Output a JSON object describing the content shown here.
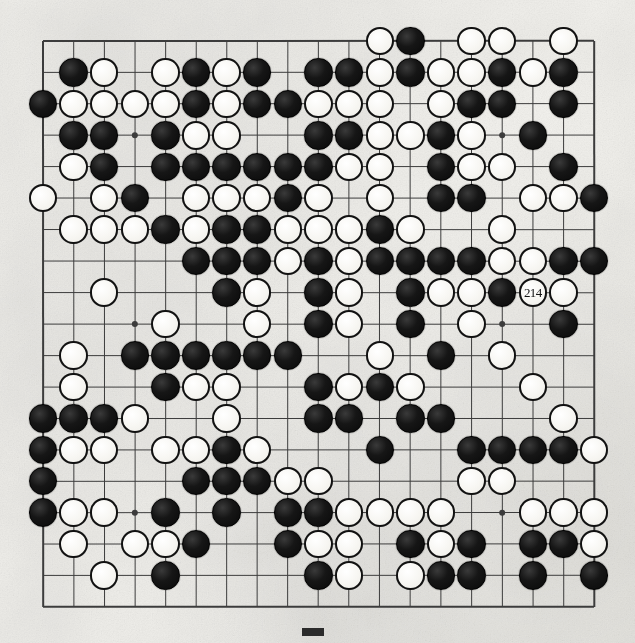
{
  "diagram": {
    "kind": "go-game-record",
    "board_size": 19,
    "title": "",
    "caption": "",
    "background_color": "#f2f1ed",
    "line_color": "#3c3c3c",
    "black_color": "#111111",
    "white_color": "#f9f8f4",
    "star_points": [
      [
        3,
        3
      ],
      [
        3,
        9
      ],
      [
        3,
        15
      ],
      [
        9,
        3
      ],
      [
        9,
        9
      ],
      [
        9,
        15
      ],
      [
        15,
        3
      ],
      [
        15,
        9
      ],
      [
        15,
        15
      ]
    ],
    "move_labels": [
      {
        "label": "214",
        "col": 16,
        "row": 8,
        "color": "white"
      }
    ],
    "stones": [
      {
        "c": 11,
        "r": 0,
        "s": "W"
      },
      {
        "c": 12,
        "r": 0,
        "s": "B"
      },
      {
        "c": 14,
        "r": 0,
        "s": "W"
      },
      {
        "c": 15,
        "r": 0,
        "s": "W"
      },
      {
        "c": 17,
        "r": 0,
        "s": "W"
      },
      {
        "c": 1,
        "r": 1,
        "s": "B"
      },
      {
        "c": 2,
        "r": 1,
        "s": "W"
      },
      {
        "c": 4,
        "r": 1,
        "s": "W"
      },
      {
        "c": 5,
        "r": 1,
        "s": "B"
      },
      {
        "c": 6,
        "r": 1,
        "s": "W"
      },
      {
        "c": 7,
        "r": 1,
        "s": "B"
      },
      {
        "c": 9,
        "r": 1,
        "s": "B"
      },
      {
        "c": 10,
        "r": 1,
        "s": "B"
      },
      {
        "c": 11,
        "r": 1,
        "s": "W"
      },
      {
        "c": 12,
        "r": 1,
        "s": "B"
      },
      {
        "c": 13,
        "r": 1,
        "s": "W"
      },
      {
        "c": 14,
        "r": 1,
        "s": "W"
      },
      {
        "c": 15,
        "r": 1,
        "s": "B"
      },
      {
        "c": 16,
        "r": 1,
        "s": "W"
      },
      {
        "c": 17,
        "r": 1,
        "s": "B"
      },
      {
        "c": 0,
        "r": 2,
        "s": "B"
      },
      {
        "c": 1,
        "r": 2,
        "s": "W"
      },
      {
        "c": 2,
        "r": 2,
        "s": "W"
      },
      {
        "c": 3,
        "r": 2,
        "s": "W"
      },
      {
        "c": 4,
        "r": 2,
        "s": "W"
      },
      {
        "c": 5,
        "r": 2,
        "s": "B"
      },
      {
        "c": 6,
        "r": 2,
        "s": "W"
      },
      {
        "c": 7,
        "r": 2,
        "s": "B"
      },
      {
        "c": 8,
        "r": 2,
        "s": "B"
      },
      {
        "c": 9,
        "r": 2,
        "s": "W"
      },
      {
        "c": 10,
        "r": 2,
        "s": "W"
      },
      {
        "c": 11,
        "r": 2,
        "s": "W"
      },
      {
        "c": 13,
        "r": 2,
        "s": "W"
      },
      {
        "c": 14,
        "r": 2,
        "s": "B"
      },
      {
        "c": 15,
        "r": 2,
        "s": "B"
      },
      {
        "c": 17,
        "r": 2,
        "s": "B"
      },
      {
        "c": 1,
        "r": 3,
        "s": "B"
      },
      {
        "c": 2,
        "r": 3,
        "s": "B"
      },
      {
        "c": 4,
        "r": 3,
        "s": "B"
      },
      {
        "c": 5,
        "r": 3,
        "s": "W"
      },
      {
        "c": 6,
        "r": 3,
        "s": "W"
      },
      {
        "c": 9,
        "r": 3,
        "s": "B"
      },
      {
        "c": 10,
        "r": 3,
        "s": "B"
      },
      {
        "c": 11,
        "r": 3,
        "s": "W"
      },
      {
        "c": 12,
        "r": 3,
        "s": "W"
      },
      {
        "c": 13,
        "r": 3,
        "s": "B"
      },
      {
        "c": 14,
        "r": 3,
        "s": "W"
      },
      {
        "c": 16,
        "r": 3,
        "s": "B"
      },
      {
        "c": 1,
        "r": 4,
        "s": "W"
      },
      {
        "c": 2,
        "r": 4,
        "s": "B"
      },
      {
        "c": 4,
        "r": 4,
        "s": "B"
      },
      {
        "c": 5,
        "r": 4,
        "s": "B"
      },
      {
        "c": 6,
        "r": 4,
        "s": "B"
      },
      {
        "c": 7,
        "r": 4,
        "s": "B"
      },
      {
        "c": 8,
        "r": 4,
        "s": "B"
      },
      {
        "c": 9,
        "r": 4,
        "s": "B"
      },
      {
        "c": 10,
        "r": 4,
        "s": "W"
      },
      {
        "c": 11,
        "r": 4,
        "s": "W"
      },
      {
        "c": 13,
        "r": 4,
        "s": "B"
      },
      {
        "c": 14,
        "r": 4,
        "s": "W"
      },
      {
        "c": 15,
        "r": 4,
        "s": "W"
      },
      {
        "c": 17,
        "r": 4,
        "s": "B"
      },
      {
        "c": 0,
        "r": 5,
        "s": "W"
      },
      {
        "c": 2,
        "r": 5,
        "s": "W"
      },
      {
        "c": 3,
        "r": 5,
        "s": "B"
      },
      {
        "c": 5,
        "r": 5,
        "s": "W"
      },
      {
        "c": 6,
        "r": 5,
        "s": "W"
      },
      {
        "c": 7,
        "r": 5,
        "s": "W"
      },
      {
        "c": 8,
        "r": 5,
        "s": "B"
      },
      {
        "c": 9,
        "r": 5,
        "s": "W"
      },
      {
        "c": 11,
        "r": 5,
        "s": "W"
      },
      {
        "c": 13,
        "r": 5,
        "s": "B"
      },
      {
        "c": 14,
        "r": 5,
        "s": "B"
      },
      {
        "c": 16,
        "r": 5,
        "s": "W"
      },
      {
        "c": 17,
        "r": 5,
        "s": "W"
      },
      {
        "c": 18,
        "r": 5,
        "s": "B"
      },
      {
        "c": 1,
        "r": 6,
        "s": "W"
      },
      {
        "c": 2,
        "r": 6,
        "s": "W"
      },
      {
        "c": 3,
        "r": 6,
        "s": "W"
      },
      {
        "c": 4,
        "r": 6,
        "s": "B"
      },
      {
        "c": 5,
        "r": 6,
        "s": "W"
      },
      {
        "c": 6,
        "r": 6,
        "s": "B"
      },
      {
        "c": 7,
        "r": 6,
        "s": "B"
      },
      {
        "c": 8,
        "r": 6,
        "s": "W"
      },
      {
        "c": 9,
        "r": 6,
        "s": "W"
      },
      {
        "c": 10,
        "r": 6,
        "s": "W"
      },
      {
        "c": 11,
        "r": 6,
        "s": "B"
      },
      {
        "c": 12,
        "r": 6,
        "s": "W"
      },
      {
        "c": 15,
        "r": 6,
        "s": "W"
      },
      {
        "c": 5,
        "r": 7,
        "s": "B"
      },
      {
        "c": 6,
        "r": 7,
        "s": "B"
      },
      {
        "c": 7,
        "r": 7,
        "s": "B"
      },
      {
        "c": 8,
        "r": 7,
        "s": "W"
      },
      {
        "c": 9,
        "r": 7,
        "s": "B"
      },
      {
        "c": 10,
        "r": 7,
        "s": "W"
      },
      {
        "c": 11,
        "r": 7,
        "s": "B"
      },
      {
        "c": 12,
        "r": 7,
        "s": "B"
      },
      {
        "c": 13,
        "r": 7,
        "s": "B"
      },
      {
        "c": 14,
        "r": 7,
        "s": "B"
      },
      {
        "c": 15,
        "r": 7,
        "s": "W"
      },
      {
        "c": 16,
        "r": 7,
        "s": "W"
      },
      {
        "c": 17,
        "r": 7,
        "s": "B"
      },
      {
        "c": 18,
        "r": 7,
        "s": "B"
      },
      {
        "c": 2,
        "r": 8,
        "s": "W"
      },
      {
        "c": 6,
        "r": 8,
        "s": "B"
      },
      {
        "c": 7,
        "r": 8,
        "s": "W"
      },
      {
        "c": 9,
        "r": 8,
        "s": "B"
      },
      {
        "c": 10,
        "r": 8,
        "s": "W"
      },
      {
        "c": 12,
        "r": 8,
        "s": "B"
      },
      {
        "c": 13,
        "r": 8,
        "s": "W"
      },
      {
        "c": 14,
        "r": 8,
        "s": "W"
      },
      {
        "c": 15,
        "r": 8,
        "s": "B"
      },
      {
        "c": 17,
        "r": 8,
        "s": "W"
      },
      {
        "c": 4,
        "r": 9,
        "s": "W"
      },
      {
        "c": 7,
        "r": 9,
        "s": "W"
      },
      {
        "c": 9,
        "r": 9,
        "s": "B"
      },
      {
        "c": 10,
        "r": 9,
        "s": "W"
      },
      {
        "c": 12,
        "r": 9,
        "s": "B"
      },
      {
        "c": 14,
        "r": 9,
        "s": "W"
      },
      {
        "c": 17,
        "r": 9,
        "s": "B"
      },
      {
        "c": 1,
        "r": 10,
        "s": "W"
      },
      {
        "c": 3,
        "r": 10,
        "s": "B"
      },
      {
        "c": 4,
        "r": 10,
        "s": "B"
      },
      {
        "c": 5,
        "r": 10,
        "s": "B"
      },
      {
        "c": 6,
        "r": 10,
        "s": "B"
      },
      {
        "c": 7,
        "r": 10,
        "s": "B"
      },
      {
        "c": 8,
        "r": 10,
        "s": "B"
      },
      {
        "c": 11,
        "r": 10,
        "s": "W"
      },
      {
        "c": 13,
        "r": 10,
        "s": "B"
      },
      {
        "c": 15,
        "r": 10,
        "s": "W"
      },
      {
        "c": 1,
        "r": 11,
        "s": "W"
      },
      {
        "c": 4,
        "r": 11,
        "s": "B"
      },
      {
        "c": 5,
        "r": 11,
        "s": "W"
      },
      {
        "c": 6,
        "r": 11,
        "s": "W"
      },
      {
        "c": 9,
        "r": 11,
        "s": "B"
      },
      {
        "c": 10,
        "r": 11,
        "s": "W"
      },
      {
        "c": 11,
        "r": 11,
        "s": "B"
      },
      {
        "c": 12,
        "r": 11,
        "s": "W"
      },
      {
        "c": 16,
        "r": 11,
        "s": "W"
      },
      {
        "c": 0,
        "r": 12,
        "s": "B"
      },
      {
        "c": 1,
        "r": 12,
        "s": "B"
      },
      {
        "c": 2,
        "r": 12,
        "s": "B"
      },
      {
        "c": 3,
        "r": 12,
        "s": "W"
      },
      {
        "c": 6,
        "r": 12,
        "s": "W"
      },
      {
        "c": 9,
        "r": 12,
        "s": "B"
      },
      {
        "c": 10,
        "r": 12,
        "s": "B"
      },
      {
        "c": 12,
        "r": 12,
        "s": "B"
      },
      {
        "c": 13,
        "r": 12,
        "s": "B"
      },
      {
        "c": 17,
        "r": 12,
        "s": "W"
      },
      {
        "c": 0,
        "r": 13,
        "s": "B"
      },
      {
        "c": 1,
        "r": 13,
        "s": "W"
      },
      {
        "c": 2,
        "r": 13,
        "s": "W"
      },
      {
        "c": 4,
        "r": 13,
        "s": "W"
      },
      {
        "c": 5,
        "r": 13,
        "s": "W"
      },
      {
        "c": 6,
        "r": 13,
        "s": "B"
      },
      {
        "c": 7,
        "r": 13,
        "s": "W"
      },
      {
        "c": 11,
        "r": 13,
        "s": "B"
      },
      {
        "c": 14,
        "r": 13,
        "s": "B"
      },
      {
        "c": 15,
        "r": 13,
        "s": "B"
      },
      {
        "c": 16,
        "r": 13,
        "s": "B"
      },
      {
        "c": 17,
        "r": 13,
        "s": "B"
      },
      {
        "c": 18,
        "r": 13,
        "s": "W"
      },
      {
        "c": 0,
        "r": 14,
        "s": "B"
      },
      {
        "c": 5,
        "r": 14,
        "s": "B"
      },
      {
        "c": 6,
        "r": 14,
        "s": "B"
      },
      {
        "c": 7,
        "r": 14,
        "s": "B"
      },
      {
        "c": 8,
        "r": 14,
        "s": "W"
      },
      {
        "c": 9,
        "r": 14,
        "s": "W"
      },
      {
        "c": 14,
        "r": 14,
        "s": "W"
      },
      {
        "c": 15,
        "r": 14,
        "s": "W"
      },
      {
        "c": 0,
        "r": 15,
        "s": "B"
      },
      {
        "c": 1,
        "r": 15,
        "s": "W"
      },
      {
        "c": 2,
        "r": 15,
        "s": "W"
      },
      {
        "c": 4,
        "r": 15,
        "s": "B"
      },
      {
        "c": 6,
        "r": 15,
        "s": "B"
      },
      {
        "c": 8,
        "r": 15,
        "s": "B"
      },
      {
        "c": 9,
        "r": 15,
        "s": "B"
      },
      {
        "c": 10,
        "r": 15,
        "s": "W"
      },
      {
        "c": 11,
        "r": 15,
        "s": "W"
      },
      {
        "c": 12,
        "r": 15,
        "s": "W"
      },
      {
        "c": 13,
        "r": 15,
        "s": "W"
      },
      {
        "c": 16,
        "r": 15,
        "s": "W"
      },
      {
        "c": 17,
        "r": 15,
        "s": "W"
      },
      {
        "c": 18,
        "r": 15,
        "s": "W"
      },
      {
        "c": 1,
        "r": 16,
        "s": "W"
      },
      {
        "c": 3,
        "r": 16,
        "s": "W"
      },
      {
        "c": 4,
        "r": 16,
        "s": "W"
      },
      {
        "c": 5,
        "r": 16,
        "s": "B"
      },
      {
        "c": 8,
        "r": 16,
        "s": "B"
      },
      {
        "c": 9,
        "r": 16,
        "s": "W"
      },
      {
        "c": 10,
        "r": 16,
        "s": "W"
      },
      {
        "c": 12,
        "r": 16,
        "s": "B"
      },
      {
        "c": 13,
        "r": 16,
        "s": "W"
      },
      {
        "c": 14,
        "r": 16,
        "s": "B"
      },
      {
        "c": 16,
        "r": 16,
        "s": "B"
      },
      {
        "c": 17,
        "r": 16,
        "s": "B"
      },
      {
        "c": 18,
        "r": 16,
        "s": "W"
      },
      {
        "c": 2,
        "r": 17,
        "s": "W"
      },
      {
        "c": 4,
        "r": 17,
        "s": "B"
      },
      {
        "c": 9,
        "r": 17,
        "s": "B"
      },
      {
        "c": 10,
        "r": 17,
        "s": "W"
      },
      {
        "c": 12,
        "r": 17,
        "s": "W"
      },
      {
        "c": 13,
        "r": 17,
        "s": "B"
      },
      {
        "c": 14,
        "r": 17,
        "s": "B"
      },
      {
        "c": 16,
        "r": 17,
        "s": "B"
      },
      {
        "c": 18,
        "r": 17,
        "s": "B"
      }
    ]
  }
}
